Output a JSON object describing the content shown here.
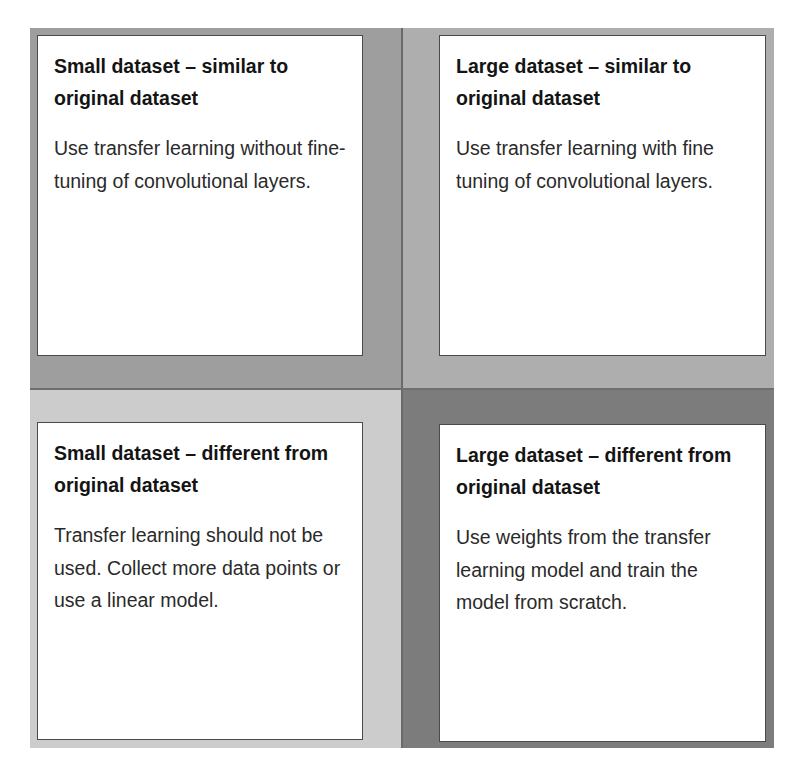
{
  "diagram": {
    "type": "2x2 decision matrix",
    "colors": {
      "top_left": "#9e9e9e",
      "top_right": "#aeaeae",
      "bottom_left": "#cccccc",
      "bottom_right": "#7c7c7c",
      "divider": "#6a6a6a",
      "card_background": "#ffffff",
      "card_border": "#4a4a4a"
    },
    "quadrants": [
      {
        "position": "top-left",
        "title": "Small dataset – similar to original dataset",
        "body": "Use transfer learning without fine-tuning of convolutional layers."
      },
      {
        "position": "top-right",
        "title": "Large dataset – similar to original dataset",
        "body": "Use transfer learning with fine tuning of convolutional layers."
      },
      {
        "position": "bottom-left",
        "title": "Small dataset – different from original dataset",
        "body": "Transfer learning should not be used. Collect more data points or use a linear model."
      },
      {
        "position": "bottom-right",
        "title": "Large dataset – different from original dataset",
        "body": "Use weights from the transfer learning model and train the model from scratch."
      }
    ]
  }
}
